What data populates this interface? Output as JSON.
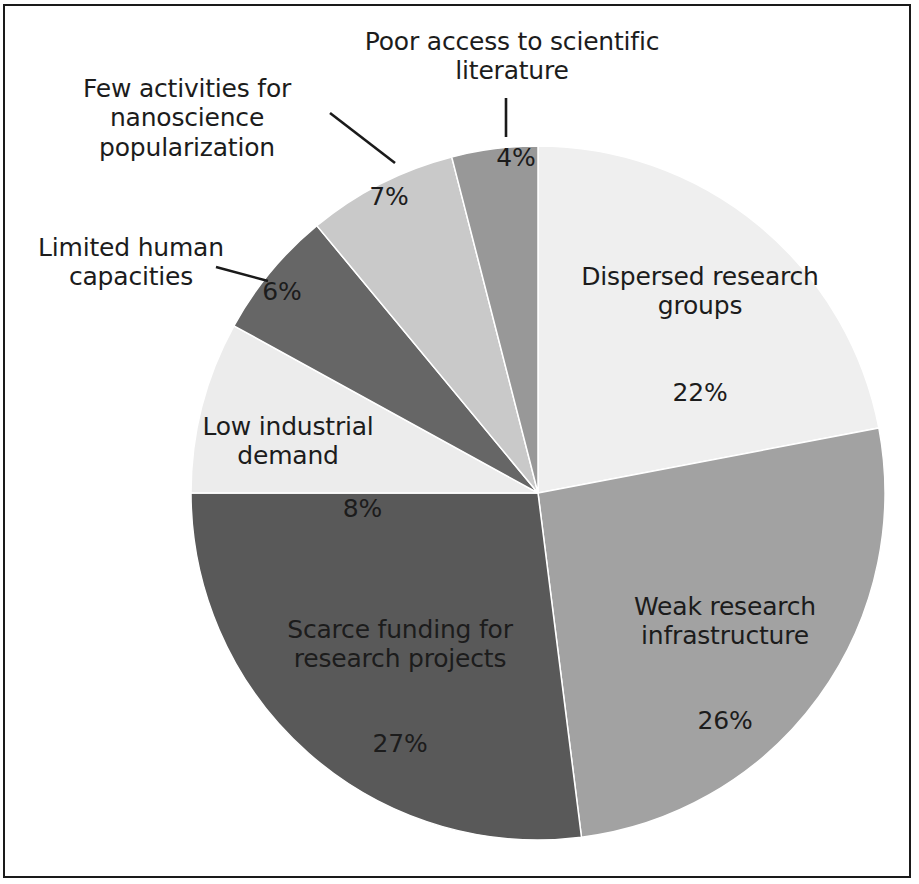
{
  "chart_data": {
    "type": "pie",
    "title": "",
    "subtitle": "",
    "xlabel": "",
    "ylabel": "",
    "legend_position": "none",
    "labels_inside": true,
    "value_suffix": "%",
    "start_angle_deg": 0,
    "direction": "clockwise",
    "categories": [
      "Dispersed research groups",
      "Weak research infrastructure",
      "Scarce funding for research projects",
      "Low industrial demand",
      "Limited human capacities",
      "Few activities for nanoscience popularization",
      "Poor access to scientific literature"
    ],
    "values": [
      22,
      26,
      27,
      8,
      6,
      7,
      4
    ],
    "value_labels": [
      "22%",
      "26%",
      "27%",
      "8%",
      "6%",
      "7%",
      "4%"
    ],
    "colors": [
      "#efefef",
      "#a2a2a2",
      "#595959",
      "#ececec",
      "#666666",
      "#c9c9c9",
      "#989898"
    ],
    "slices": [
      {
        "id": "dispersed-research-groups",
        "label": "Dispersed research\ngroups",
        "label_flat": "Dispersed research groups",
        "value": 22,
        "value_label": "22%",
        "color": "#efefef",
        "label_placement": "inside"
      },
      {
        "id": "weak-research-infrastructure",
        "label": "Weak research\ninfrastructure",
        "label_flat": "Weak research infrastructure",
        "value": 26,
        "value_label": "26%",
        "color": "#a2a2a2",
        "label_placement": "inside"
      },
      {
        "id": "scarce-funding-for-research-projects",
        "label": "Scarce funding for\nresearch projects",
        "label_flat": "Scarce funding for research projects",
        "value": 27,
        "value_label": "27%",
        "color": "#595959",
        "label_placement": "inside"
      },
      {
        "id": "low-industrial-demand",
        "label": "Low industrial\ndemand",
        "label_flat": "Low industrial demand",
        "value": 8,
        "value_label": "8%",
        "color": "#ececec",
        "label_placement": "inside"
      },
      {
        "id": "limited-human-capacities",
        "label": "Limited human\ncapacities",
        "label_flat": "Limited human capacities",
        "value": 6,
        "value_label": "6%",
        "color": "#666666",
        "label_placement": "callout-left"
      },
      {
        "id": "few-activities-for-nanoscience-popularization",
        "label": "Few activities for\nnanoscience popularization",
        "label_flat": "Few activities for nanoscience popularization",
        "value": 7,
        "value_label": "7%",
        "color": "#c9c9c9",
        "label_placement": "callout-upper-left"
      },
      {
        "id": "poor-access-to-scientific-literature",
        "label": "Poor access to scientific\nliterature",
        "label_flat": "Poor access to scientific literature",
        "value": 4,
        "value_label": "4%",
        "color": "#989898",
        "label_placement": "callout-top"
      }
    ]
  },
  "figure": {
    "background_color": "#ffffff",
    "text_color": "#1c1c1c",
    "border_color": "#1a1a1a",
    "slice_edge_color": "#ffffff"
  }
}
